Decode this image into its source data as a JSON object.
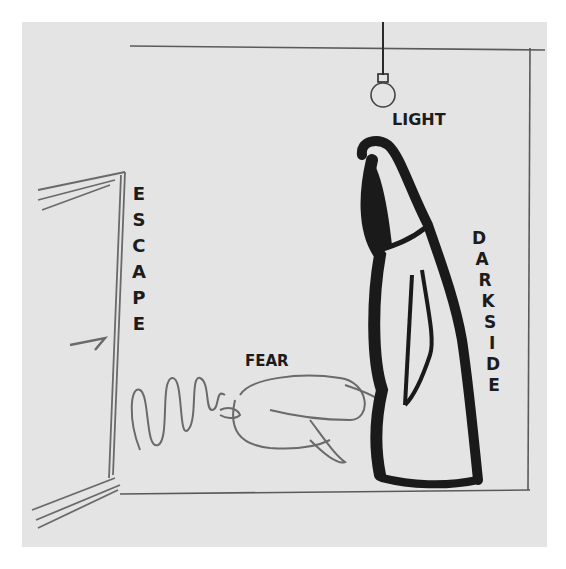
{
  "image": {
    "kind": "pencil and marker sketch on paper",
    "paper_color": "#e4e4e4",
    "ink_color": "#1a1a1a",
    "pencil_color": "#6a6a6a"
  },
  "labels": {
    "light": "LIGHT",
    "escape": [
      "E",
      "S",
      "C",
      "A",
      "P",
      "E"
    ],
    "fear": "FEAR",
    "darkside": [
      "D",
      "A",
      "R",
      "K",
      "S",
      "I",
      "D",
      "E"
    ]
  },
  "elements": {
    "light_bulb": "hanging light bulb at top center",
    "door": "open door on the left",
    "crouching_figure": "curled up figure labeled fear",
    "dark_figure": "tall hooded dark figure labeled darkside",
    "spring": "squiggle between door and figure"
  }
}
